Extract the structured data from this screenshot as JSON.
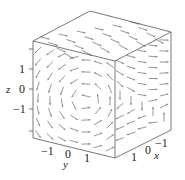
{
  "chart_data": {
    "type": "vector-field-3d",
    "title": "",
    "axes": {
      "x": {
        "label": "x",
        "ticks": [
          "1",
          "0",
          "-1"
        ],
        "range": [
          -2,
          2
        ]
      },
      "y": {
        "label": "y",
        "ticks": [
          "-1",
          "0",
          "1"
        ],
        "range": [
          -2,
          2
        ]
      },
      "z": {
        "label": "z",
        "ticks": [
          "1",
          "0",
          "-1"
        ],
        "range": [
          -2,
          2
        ]
      }
    },
    "box": true,
    "arrow_color": "#8a8a8a",
    "box_color": "#555555"
  },
  "labels": {
    "x_axis": "x",
    "y_axis": "y",
    "z_axis": "z",
    "z_ticks": [
      "1",
      "0",
      "−1"
    ],
    "y_ticks": [
      "−1",
      "0",
      "1"
    ],
    "x_ticks": [
      "1",
      "0",
      "−1"
    ]
  }
}
